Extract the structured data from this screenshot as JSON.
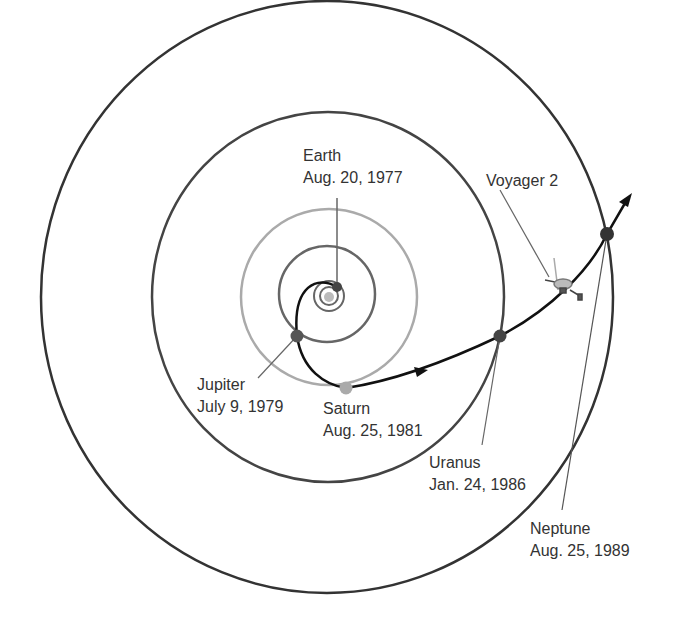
{
  "diagram": {
    "spacecraft_label": "Voyager 2",
    "encounters": [
      {
        "planet": "Earth",
        "date": "Aug. 20, 1977"
      },
      {
        "planet": "Jupiter",
        "date": "July 9, 1979"
      },
      {
        "planet": "Saturn",
        "date": "Aug. 25, 1981"
      },
      {
        "planet": "Uranus",
        "date": "Jan. 24, 1986"
      },
      {
        "planet": "Neptune",
        "date": "Aug. 25, 1989"
      }
    ],
    "colors": {
      "outer_orbit": "#333333",
      "jupiter_orbit": "#666666",
      "saturn_orbit": "#aaaaaa",
      "trajectory": "#111111",
      "planet_dark": "#444444",
      "planet_light": "#aaaaaa",
      "text": "#333333"
    }
  }
}
